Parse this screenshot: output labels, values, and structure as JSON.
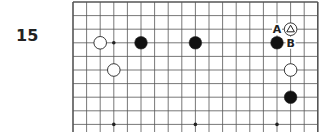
{
  "problem": {
    "number": "15"
  },
  "board": {
    "origin_x": 73,
    "origin_y": 2,
    "spacing": 13.6,
    "cols": 19,
    "rows_visible": 10,
    "edges": {
      "left": true,
      "top": true,
      "right": true,
      "bottom": false
    },
    "line_color": "#555555",
    "hoshi": [
      [
        3,
        3
      ],
      [
        9,
        9
      ],
      [
        15,
        9
      ],
      [
        3,
        9
      ]
    ],
    "stones": [
      {
        "color": "white",
        "col": 2,
        "row": 3
      },
      {
        "color": "black",
        "col": 5,
        "row": 3
      },
      {
        "color": "black",
        "col": 9,
        "row": 3
      },
      {
        "color": "black",
        "col": 15,
        "row": 3
      },
      {
        "color": "white",
        "col": 16,
        "row": 2,
        "marker": "triangle"
      },
      {
        "color": "white",
        "col": 3,
        "row": 5
      },
      {
        "color": "white",
        "col": 16,
        "row": 5
      },
      {
        "color": "black",
        "col": 16,
        "row": 7
      }
    ],
    "labels": [
      {
        "text": "A",
        "col": 15,
        "row": 2
      },
      {
        "text": "B",
        "col": 16,
        "row": 3
      }
    ]
  }
}
